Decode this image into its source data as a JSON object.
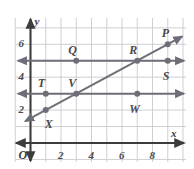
{
  "figure": {
    "kind": "coordinate-plane-graph",
    "background_color": "#ffffff",
    "grid_color": "#c9c9cd",
    "axis_color": "#3c3c3c",
    "line_color": "#6e6e78",
    "point_color": "#6e6e78",
    "label_color": "#4a4a4a"
  },
  "axes": {
    "x_axis_name": "x",
    "y_axis_name": "y",
    "origin_label": "O",
    "x_ticks": [
      {
        "value": 2,
        "label": "2"
      },
      {
        "value": 4,
        "label": "4"
      },
      {
        "value": 6,
        "label": "6"
      },
      {
        "value": 8,
        "label": "8"
      }
    ],
    "y_ticks": [
      {
        "value": 2,
        "label": "2"
      },
      {
        "value": 4,
        "label": "4"
      },
      {
        "value": 6,
        "label": "6"
      }
    ],
    "x_range": [
      -0.55,
      10.2
    ],
    "y_range": [
      -1.3,
      7.6
    ],
    "x_arrow_both_ends": true,
    "y_arrow_both_ends": true
  },
  "chart_data": {
    "type": "scatter",
    "title": "",
    "xlabel": "x",
    "ylabel": "y",
    "xlim": [
      -0.55,
      10.2
    ],
    "ylim": [
      -1.3,
      7.6
    ],
    "grid": true,
    "grid_step": 1,
    "xticks": [
      2,
      4,
      6,
      8
    ],
    "yticks": [
      2,
      4,
      6,
      8
    ],
    "points": [
      {
        "name": "P",
        "x": 9,
        "y": 6,
        "label_dx": -2,
        "label_dy": -11
      },
      {
        "name": "Q",
        "x": 3,
        "y": 5,
        "label_dx": -4,
        "label_dy": -11
      },
      {
        "name": "R",
        "x": 7,
        "y": 5,
        "label_dx": -4,
        "label_dy": -11
      },
      {
        "name": "S",
        "x": 9,
        "y": 5,
        "label_dx": -1,
        "label_dy": 15
      },
      {
        "name": "T",
        "x": 1,
        "y": 3,
        "label_dx": -4,
        "label_dy": -11
      },
      {
        "name": "V",
        "x": 3,
        "y": 3,
        "label_dx": -4,
        "label_dy": -11
      },
      {
        "name": "W",
        "x": 7,
        "y": 3,
        "label_dx": -4,
        "label_dy": 15
      },
      {
        "name": "X",
        "x": 1,
        "y": 2,
        "label_dx": 3,
        "label_dy": 14
      }
    ],
    "lines": [
      {
        "name": "slanted-line",
        "kind": "linear",
        "slope": 0.5,
        "intercept": 1.5,
        "equation": "y = 0.5x + 1.5",
        "passes_through": [
          [
            1,
            2
          ],
          [
            3,
            3
          ],
          [
            7,
            5
          ],
          [
            9,
            6
          ]
        ],
        "arrows": "both"
      },
      {
        "name": "horizontal-line-y5",
        "kind": "horizontal",
        "y": 5,
        "equation": "y = 5",
        "arrows": "both"
      },
      {
        "name": "horizontal-line-y3",
        "kind": "horizontal",
        "y": 3,
        "equation": "y = 3",
        "arrows": "both"
      }
    ]
  }
}
